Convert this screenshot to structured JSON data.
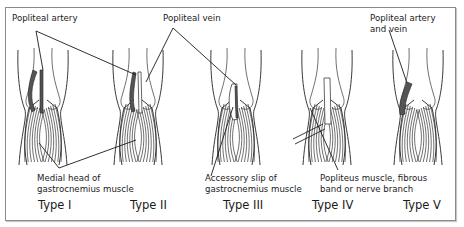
{
  "figure": {
    "labels": {
      "popliteal_artery": "Popliteal artery",
      "popliteal_vein": "Popliteal vein",
      "popliteal_artery_and_vein_line1": "Popliteal artery",
      "popliteal_artery_and_vein_line2": "and vein",
      "medial_head_line1": "Medial head of",
      "medial_head_line2": "gastrocnemius muscle",
      "accessory_slip_line1": "Accessory slip of",
      "accessory_slip_line2": "gastrocnemius muscle",
      "popliteus_line1": "Popliteus muscle, fibrous",
      "popliteus_line2": "band or nerve branch"
    },
    "types": [
      {
        "label": "Type I"
      },
      {
        "label": "Type II"
      },
      {
        "label": "Type III"
      },
      {
        "label": "Type IV"
      },
      {
        "label": "Type V"
      }
    ]
  }
}
